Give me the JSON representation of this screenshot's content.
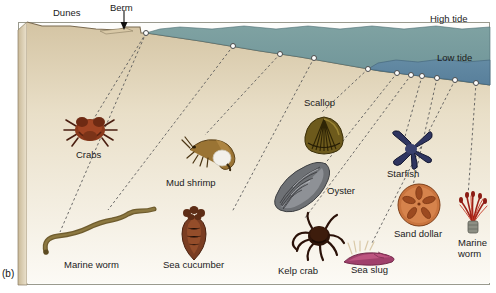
{
  "figure": {
    "panel_label": "(b)",
    "caption_present": false
  },
  "terrain": {
    "labels": [
      {
        "id": "dunes",
        "text": "Dunes",
        "x": 53,
        "y": 7,
        "name": "label-dunes"
      },
      {
        "id": "berm",
        "text": "Berm",
        "x": 110,
        "y": 2,
        "name": "label-berm"
      },
      {
        "id": "high_tide",
        "text": "High tide",
        "x": 430,
        "y": 13,
        "name": "label-high-tide"
      },
      {
        "id": "low_tide",
        "text": "Low tide",
        "x": 437,
        "y": 52,
        "name": "label-low-tide"
      }
    ],
    "colors": {
      "sand_light": "#efe4cf",
      "sand_mid": "#e2d3b6",
      "sand_dark": "#cbbb9a",
      "water_high": "#74999c",
      "water_low": "#5f86a0",
      "outline": "#6b5f4c",
      "frame": "#9a9a8e"
    }
  },
  "tide_markers": [
    {
      "id": "m1",
      "x": 146,
      "y": 33
    },
    {
      "id": "m2",
      "x": 233,
      "y": 46
    },
    {
      "id": "m3",
      "x": 280,
      "y": 54
    },
    {
      "id": "m4",
      "x": 314,
      "y": 58
    },
    {
      "id": "m5",
      "x": 368,
      "y": 69
    },
    {
      "id": "m6",
      "x": 397,
      "y": 73
    },
    {
      "id": "m7",
      "x": 411,
      "y": 75
    },
    {
      "id": "m8",
      "x": 422,
      "y": 76
    },
    {
      "id": "m9",
      "x": 437,
      "y": 78
    },
    {
      "id": "m10",
      "x": 455,
      "y": 80
    },
    {
      "id": "m11",
      "x": 476,
      "y": 83
    }
  ],
  "organisms": [
    {
      "id": "crabs",
      "label": "Crabs",
      "label_x": 76,
      "label_y": 149,
      "art_x": 60,
      "art_y": 108,
      "marker": "m1",
      "name": "organism-crabs"
    },
    {
      "id": "mud_shrimp",
      "label": "Mud shrimp",
      "label_x": 166,
      "label_y": 177,
      "art_x": 180,
      "art_y": 128,
      "marker": "m3",
      "name": "organism-mud-shrimp"
    },
    {
      "id": "marine_worm_l",
      "label": "Marine worm",
      "label_x": 64,
      "label_y": 259,
      "art_x": 38,
      "art_y": 208,
      "marker": "m2",
      "name": "organism-marine-worm-left"
    },
    {
      "id": "sea_cucumber",
      "label": "Sea cucumber",
      "label_x": 163,
      "label_y": 259,
      "art_x": 172,
      "art_y": 204,
      "marker": "m4",
      "name": "organism-sea-cucumber"
    },
    {
      "id": "scallop",
      "label": "Scallop",
      "label_x": 304,
      "label_y": 97,
      "art_x": 302,
      "art_y": 113,
      "marker": "m5",
      "name": "organism-scallop"
    },
    {
      "id": "oyster",
      "label": "Oyster",
      "label_x": 327,
      "label_y": 185,
      "art_x": 272,
      "art_y": 158,
      "marker": "m6",
      "name": "organism-oyster"
    },
    {
      "id": "kelp_crab",
      "label": "Kelp crab",
      "label_x": 278,
      "label_y": 265,
      "art_x": 288,
      "art_y": 211,
      "marker": "m7",
      "name": "organism-kelp-crab"
    },
    {
      "id": "starfish",
      "label": "Starfish",
      "label_x": 387,
      "label_y": 168,
      "art_x": 388,
      "art_y": 129,
      "marker": "m8",
      "name": "organism-starfish"
    },
    {
      "id": "sand_dollar",
      "label": "Sand dollar",
      "label_x": 394,
      "label_y": 228,
      "art_x": 395,
      "art_y": 181,
      "marker": "m9",
      "name": "organism-sand-dollar"
    },
    {
      "id": "sea_slug",
      "label": "Sea slug",
      "label_x": 351,
      "label_y": 264,
      "art_x": 340,
      "art_y": 238,
      "marker": "m10",
      "name": "organism-sea-slug"
    },
    {
      "id": "marine_worm_r",
      "label": "Marine",
      "label2": "worm",
      "label_x": 458,
      "label_y": 237,
      "art_x": 455,
      "art_y": 183,
      "marker": "m11",
      "name": "organism-marine-worm-right"
    }
  ],
  "leaders": [
    {
      "from_marker": "m1",
      "to_x": 90,
      "to_y": 125,
      "name": "leader-crabs"
    },
    {
      "from_marker": "m1",
      "to_x": 60,
      "to_y": 232,
      "name": "leader-marine-worm-left"
    },
    {
      "from_marker": "m2",
      "to_x": 108,
      "to_y": 210,
      "name": "leader-marine-worm-left-2"
    },
    {
      "from_marker": "m3",
      "to_x": 205,
      "to_y": 135,
      "name": "leader-mud-shrimp"
    },
    {
      "from_marker": "m4",
      "to_x": 232,
      "to_y": 212,
      "name": "leader-sea-cucumber"
    },
    {
      "from_marker": "m5",
      "to_x": 322,
      "to_y": 112,
      "name": "leader-scallop"
    },
    {
      "from_marker": "m6",
      "to_x": 312,
      "to_y": 180,
      "name": "leader-oyster"
    },
    {
      "from_marker": "m7",
      "to_x": 305,
      "to_y": 218,
      "name": "leader-kelp-crab"
    },
    {
      "from_marker": "m8",
      "to_x": 404,
      "to_y": 140,
      "name": "leader-starfish"
    },
    {
      "from_marker": "m9",
      "to_x": 412,
      "to_y": 190,
      "name": "leader-sand-dollar"
    },
    {
      "from_marker": "m10",
      "to_x": 372,
      "to_y": 243,
      "name": "leader-sea-slug"
    },
    {
      "from_marker": "m11",
      "to_x": 468,
      "to_y": 196,
      "name": "leader-marine-worm-right"
    }
  ]
}
